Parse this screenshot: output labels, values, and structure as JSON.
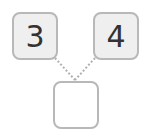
{
  "puzzle": {
    "left_value": "3",
    "right_value": "4",
    "answer_value": ""
  },
  "colors": {
    "border": "#b8b8b8",
    "filled_bg": "#efefef",
    "text": "#333333",
    "connector": "#b0b0b0"
  }
}
